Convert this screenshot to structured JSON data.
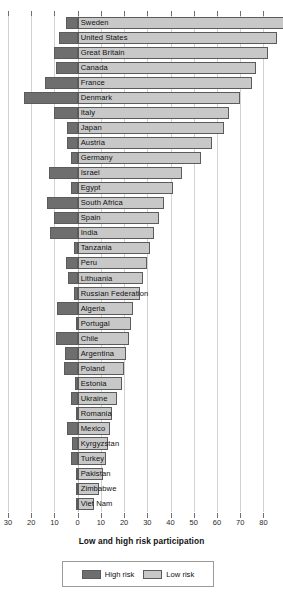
{
  "chart_data": {
    "type": "bar",
    "orientation": "horizontal",
    "layout": "diverging-stacked",
    "title": "",
    "xlabel": "Low and high risk participation",
    "ylabel": "",
    "xlim": [
      -30,
      85
    ],
    "grid": true,
    "axis_ticks": [
      {
        "label": "30",
        "value": -30
      },
      {
        "label": "20",
        "value": -20
      },
      {
        "label": "10",
        "value": -10
      },
      {
        "label": "0",
        "value": 0
      },
      {
        "label": "10",
        "value": 10
      },
      {
        "label": "20",
        "value": 20
      },
      {
        "label": "30",
        "value": 30
      },
      {
        "label": "40",
        "value": 40
      },
      {
        "label": "50",
        "value": 50
      },
      {
        "label": "60",
        "value": 60
      },
      {
        "label": "70",
        "value": 70
      },
      {
        "label": "80",
        "value": 80
      }
    ],
    "legend": {
      "position": "bottom",
      "entries": [
        {
          "name": "High risk",
          "color": "#6e6e6e"
        },
        {
          "name": "Low risk",
          "color": "#c8c8c8"
        }
      ]
    },
    "categories": [
      "Sweden",
      "United States",
      "Great Britain",
      "Canada",
      "France",
      "Denmark",
      "Italy",
      "Japan",
      "Austria",
      "Germany",
      "Israel",
      "Egypt",
      "South Africa",
      "Spain",
      "India",
      "Tanzania",
      "Peru",
      "Lithuania",
      "Russian Federation",
      "Algeria",
      "Portugal",
      "Chile",
      "Argentina",
      "Poland",
      "Estonia",
      "Ukraine",
      "Romania",
      "Mexico",
      "Kyrgyzstan",
      "Turkey",
      "Pakistan",
      "Zimbabwe",
      "Viet Nam"
    ],
    "series": [
      {
        "name": "High risk",
        "color": "#6e6e6e",
        "direction": "left",
        "values": [
          5,
          8,
          10,
          9.5,
          14,
          23,
          10,
          4.5,
          4.5,
          3,
          12.5,
          3,
          13,
          10,
          12,
          1.5,
          5,
          4,
          1.5,
          9,
          0.5,
          9.5,
          5.5,
          6,
          1,
          3,
          0.5,
          4.5,
          2.5,
          3,
          0.5,
          0.5,
          0.5
        ]
      },
      {
        "name": "Low risk",
        "color": "#c8c8c8",
        "direction": "right",
        "values": [
          90,
          86,
          82,
          77,
          75,
          70,
          65,
          63,
          58,
          53,
          45,
          41,
          37,
          35,
          33,
          31,
          30,
          28,
          27,
          24,
          23,
          22,
          21,
          20,
          19,
          17,
          15,
          14,
          13,
          12,
          11,
          9,
          7
        ]
      }
    ]
  }
}
